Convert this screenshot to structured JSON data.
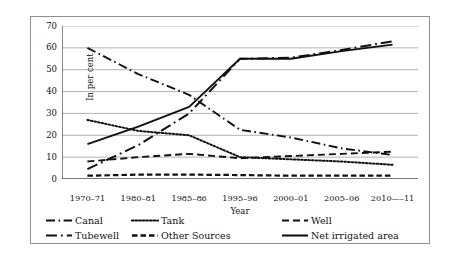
{
  "chart_data": {
    "type": "line",
    "title": "",
    "xlabel": "Year",
    "ylabel": "In per cent",
    "categories": [
      "1970–71",
      "1980–81",
      "1985–86",
      "1995–96",
      "2000–01",
      "2005–06",
      "2010—–11"
    ],
    "ylim": [
      0,
      70
    ],
    "yticks": [
      0,
      10,
      20,
      30,
      40,
      50,
      60,
      70
    ],
    "grid": true,
    "legend_position": "bottom",
    "series": [
      {
        "name": "Canal",
        "key": "canal",
        "dash": "dash-dot",
        "values": [
          60,
          48,
          38.5,
          22.5,
          19,
          14,
          11
        ]
      },
      {
        "name": "Tank",
        "key": "tank",
        "dash": "dotted",
        "values": [
          27,
          22,
          20,
          10,
          9,
          8,
          6.5
        ]
      },
      {
        "name": "Well",
        "key": "well",
        "dash": "dashed-long",
        "values": [
          8,
          10,
          11.5,
          9.5,
          10.5,
          11.5,
          12.5
        ]
      },
      {
        "name": "Tubewell",
        "key": "tube",
        "dash": "dash-dot-long",
        "values": [
          4.5,
          15.5,
          30,
          55,
          55.5,
          59,
          63
        ]
      },
      {
        "name": "Other Sources",
        "key": "other",
        "dash": "dashed-short",
        "values": [
          1.5,
          2,
          2,
          1.8,
          1.5,
          1.5,
          1.5
        ]
      },
      {
        "name": "Net irrigated area",
        "key": "net",
        "dash": "solid",
        "values": [
          16,
          24,
          33,
          55,
          55,
          58.5,
          61.5
        ]
      }
    ]
  },
  "axis": {
    "y_title": "In per cent",
    "x_title": "Year"
  },
  "legend": {
    "rows": [
      [
        {
          "label": "Canal",
          "key": "canal"
        },
        {
          "label": "Tank",
          "key": "tank"
        },
        {
          "label": "Well",
          "key": "well"
        }
      ],
      [
        {
          "label": "Tubewell",
          "key": "tube"
        },
        {
          "label": "Other Sources",
          "key": "other"
        },
        {
          "label": "Net irrigated area",
          "key": "net"
        }
      ]
    ]
  }
}
